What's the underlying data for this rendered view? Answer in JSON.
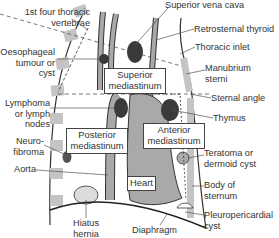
{
  "diagram": {
    "colors": {
      "organ_fill": "#a9a9a9",
      "dark_mass": "#3a3a3a",
      "vertebra": "#c4c4c4",
      "line": "#333333",
      "cyst_fill": "#dcdcdc"
    },
    "regions": {
      "superior": [
        "Superior",
        "mediastinum"
      ],
      "posterior": [
        "Posterior",
        "mediastinum"
      ],
      "anterior": [
        "Anterior",
        "mediastinum"
      ],
      "heart": "Heart"
    },
    "left_labels": {
      "vertebrae": [
        "1st four thoracic",
        "vertebrae"
      ],
      "oesophageal": [
        "Oesophageal",
        "tumour or",
        "cyst"
      ],
      "lymphoma": [
        "Lymphoma",
        "or lymph",
        "nodes"
      ],
      "neurofibroma": [
        "Neuro-",
        "fibroma"
      ],
      "aorta": "Aorta"
    },
    "right_labels": {
      "svc": "Superior vena cava",
      "thyroid": "Retrosternal thyroid",
      "inlet": "Thoracic inlet",
      "manubrium": [
        "Manubrium",
        "sterni"
      ],
      "sternal_angle": "Sternal angle",
      "thymus": "Thymus",
      "teratoma": [
        "Teratoma or",
        "dermoid cyst"
      ],
      "body_sternum": [
        "Body of",
        "sternum"
      ],
      "pleuropericardial": [
        "Pleuropericardial",
        "cyst"
      ]
    },
    "bottom_labels": {
      "hiatus": [
        "Hiatus",
        "hernia"
      ],
      "diaphragm": "Diaphragm"
    }
  }
}
